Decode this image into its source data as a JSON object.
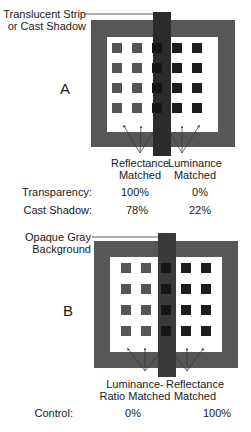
{
  "panel_a": {
    "letter": "A",
    "callout_line1": "Translucent Strip",
    "callout_line2": "or Cast Shadow",
    "left_label_line1": "Reflectance",
    "left_label_line2": "Matched",
    "right_label_line1": "Luminance",
    "right_label_line2": "Matched",
    "rows": [
      {
        "label": "Transparency:",
        "left": "100%",
        "right": "0%"
      },
      {
        "label": "Cast Shadow:",
        "left": "78%",
        "right": "22%"
      }
    ]
  },
  "panel_b": {
    "letter": "B",
    "callout_line1": "Opaque Gray",
    "callout_line2": "Background",
    "left_label_line1": "Luminance-",
    "left_label_line2": "Ratio Matched",
    "right_label_line1": "Reflectance",
    "right_label_line2": "Matched",
    "rows": [
      {
        "label": "Control:",
        "left": "0%",
        "right": "100%"
      }
    ]
  },
  "colors": {
    "frame": "#575757",
    "inner": "#ffffff",
    "strip": "#2b2b2b",
    "left_squares": "#555555",
    "strip_squares": "#161616",
    "right_squares": "#1c1c1c",
    "arrow": "#333333"
  }
}
